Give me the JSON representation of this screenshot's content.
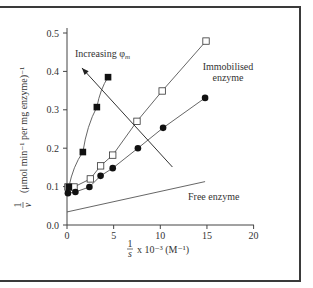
{
  "chart_data": {
    "type": "scatter",
    "title": "",
    "xlabel": "1/s x 10^-3 (M^-1)",
    "ylabel": "1/v (μmol min^-1 per mg enzyme)^-1",
    "xlim": [
      0,
      20
    ],
    "ylim": [
      0,
      0.5
    ],
    "x_ticks": [
      0,
      5,
      10,
      15,
      20
    ],
    "y_ticks": [
      0.0,
      0.1,
      0.2,
      0.3,
      0.4,
      0.5
    ],
    "grid": false,
    "legend": null,
    "series": [
      {
        "name": "Immobilised enzyme (open squares)",
        "marker": "open-square",
        "points": [
          [
            0.1,
            0.099
          ],
          [
            0.75,
            0.099
          ],
          [
            2.5,
            0.12
          ],
          [
            3.6,
            0.154
          ],
          [
            4.9,
            0.182
          ],
          [
            7.5,
            0.27
          ],
          [
            10.2,
            0.349
          ],
          [
            14.9,
            0.479
          ]
        ]
      },
      {
        "name": "Immobilised enzyme (filled circles)",
        "marker": "filled-circle",
        "points": [
          [
            0.1,
            0.083
          ],
          [
            0.9,
            0.086
          ],
          [
            2.4,
            0.099
          ],
          [
            3.6,
            0.128
          ],
          [
            4.9,
            0.148
          ],
          [
            7.6,
            0.2
          ],
          [
            10.3,
            0.253
          ],
          [
            14.8,
            0.331
          ]
        ]
      },
      {
        "name": "Immobilised enzyme (filled squares)",
        "marker": "filled-square",
        "points": [
          [
            0.2,
            0.099
          ],
          [
            1.7,
            0.19
          ],
          [
            3.2,
            0.307
          ],
          [
            4.4,
            0.385
          ]
        ]
      },
      {
        "name": "Free enzyme",
        "marker": "line",
        "points": [
          [
            0,
            0.034
          ],
          [
            14.8,
            0.113
          ]
        ]
      }
    ],
    "annotations": [
      {
        "text": "Increasing φm",
        "type": "arrow",
        "from": [
          11.3,
          0.151
        ],
        "to": [
          1.6,
          0.409
        ]
      },
      {
        "text": "Immobilised enzyme",
        "position": [
          15.5,
          0.4
        ]
      },
      {
        "text": "Free enzyme",
        "position": [
          17.3,
          0.073
        ]
      }
    ]
  },
  "labels": {
    "y_axis_prefix_num": "1",
    "y_axis_prefix_den": "v",
    "y_axis_text": "(μmol min⁻¹ per mg enzyme)⁻¹",
    "x_axis_frac_num": "1",
    "x_axis_frac_den": "s",
    "x_axis_text": "x 10⁻³ (M⁻¹)",
    "increasing": "Increasing φ",
    "increasing_sub": "m",
    "immobilised_line1": "Immobilised",
    "immobilised_line2": "enzyme",
    "free_enzyme": "Free enzyme",
    "xticks": [
      "0",
      "5",
      "10",
      "15",
      "20"
    ],
    "yticks": [
      "0.0",
      "0.1",
      "0.2",
      "0.3",
      "0.4",
      "0.5"
    ]
  }
}
